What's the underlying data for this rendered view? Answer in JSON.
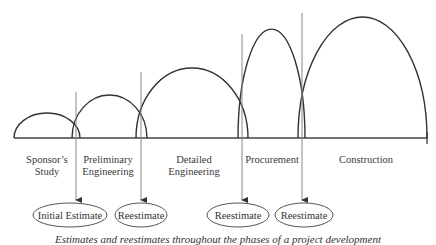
{
  "diagram": {
    "baseline": {
      "x1": 14,
      "x2": 428,
      "y": 138
    },
    "phases": [
      {
        "label_lines": [
          "Sponsor's",
          "Study"
        ],
        "arc": {
          "x1": 14,
          "x2": 80,
          "top": 113
        },
        "label_x": 46
      },
      {
        "label_lines": [
          "Preliminary",
          "Engineering"
        ],
        "arc": {
          "x1": 72,
          "x2": 147,
          "top": 95
        },
        "label_x": 110
      },
      {
        "label_lines": [
          "Detailed",
          "Engineering"
        ],
        "arc": {
          "x1": 136,
          "x2": 248,
          "top": 68
        },
        "label_x": 195
      },
      {
        "label_lines": [
          "Procurement"
        ],
        "arc": {
          "x1": 238,
          "x2": 305,
          "top": 29
        },
        "label_x": 270
      },
      {
        "label_lines": [
          "Construction"
        ],
        "arc": {
          "x1": 298,
          "x2": 427,
          "top": 17
        },
        "label_x": 365
      }
    ],
    "milestones": [
      {
        "x": 76,
        "line_top": 92,
        "estimate": "Initial Estimate",
        "ellipse": {
          "cx": 70,
          "rx": 37
        }
      },
      {
        "x": 141,
        "line_top": 72,
        "estimate": "Reestimate",
        "ellipse": {
          "cx": 141,
          "rx": 26
        }
      },
      {
        "x": 242,
        "line_top": 34,
        "estimate": "Reestimate",
        "ellipse": {
          "cx": 238,
          "rx": 31
        }
      },
      {
        "x": 302,
        "line_top": 13,
        "estimate": "Reestimate",
        "ellipse": {
          "cx": 304,
          "rx": 29
        }
      }
    ],
    "ellipse_cy": 215,
    "ellipse_ry": 12,
    "caption": "Estimates and reestimates throughout the phases of a project development"
  },
  "labels": {
    "phase_0_line_0": "Sponsor’s",
    "phase_0_line_1": "Study",
    "phase_1_line_0": "Preliminary",
    "phase_1_line_1": "Engineering",
    "phase_2_line_0": "Detailed",
    "phase_2_line_1": "Engineering",
    "phase_3_line_0": "Procurement",
    "phase_4_line_0": "Construction",
    "estimate_0": "Initial Estimate",
    "estimate_1": "Reestimate",
    "estimate_2": "Reestimate",
    "estimate_3": "Reestimate"
  },
  "colors": {
    "line": "#333333",
    "milestone_line": "#888888",
    "text": "#333333"
  }
}
